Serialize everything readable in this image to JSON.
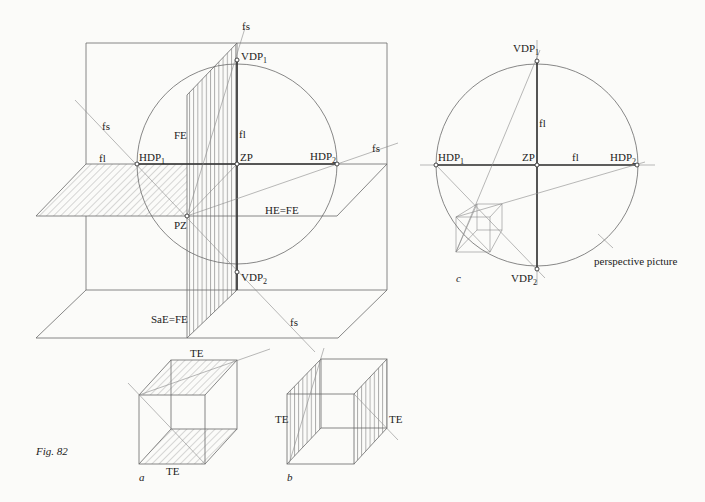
{
  "figure": {
    "caption": "Fig. 82",
    "subfigures": [
      "a",
      "b",
      "c"
    ]
  },
  "main_view": {
    "labels": {
      "fs_top": "fs",
      "fs_left": "fs",
      "fs_right": "fs",
      "fs_bottom": "fs",
      "fl_horizontal": "fl",
      "fl_vertical": "fl",
      "FE": "FE",
      "HDP1": "HDP",
      "HDP1_sub": "1",
      "HDP2": "HDP",
      "HDP2_sub": "2",
      "VDP1": "VDP",
      "VDP1_sub": "1",
      "VDP2": "VDP",
      "VDP2_sub": "2",
      "ZP": "ZP",
      "PZ": "PZ",
      "HE_FE": "HE=FE",
      "SaE_FE": "SaE=FE"
    }
  },
  "cube_a": {
    "label": "a",
    "top_face": "TE",
    "bottom_face": "TE"
  },
  "cube_b": {
    "label": "b",
    "left_face": "TE",
    "right_face": "TE"
  },
  "view_c": {
    "label": "c",
    "labels": {
      "VDP1": "VDP",
      "VDP1_sub": "1",
      "VDP2": "VDP",
      "VDP2_sub": "2",
      "HDP1": "HDP",
      "HDP1_sub": "1",
      "HDP2": "HDP",
      "HDP2_sub": "2",
      "ZP": "ZP",
      "fl_horizontal": "fl",
      "fl_vertical": "fl",
      "perspective_picture": "perspective picture"
    }
  }
}
